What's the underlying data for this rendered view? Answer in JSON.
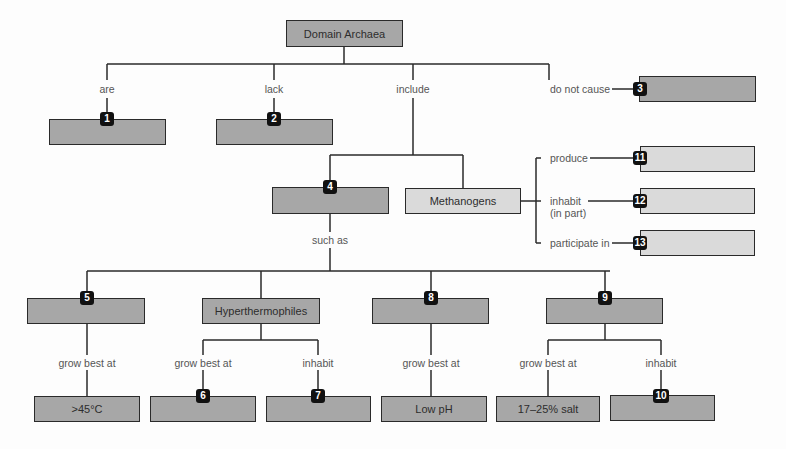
{
  "diagram": {
    "type": "concept-map",
    "colors": {
      "box_dark": "#a7a7a7",
      "box_light": "#dadada",
      "line": "#2a2a2a",
      "badge": "#111111"
    },
    "root": {
      "label": "Domain Archaea"
    },
    "links": {
      "are": "are",
      "lack": "lack",
      "include": "include",
      "do_not_cause": "do not cause",
      "such_as": "such as",
      "produce": "produce",
      "inhabit_in_part": "inhabit\n(in part)",
      "participate_in": "participate in",
      "grow_best_at_5": "grow best at",
      "grow_best_at_hyper": "grow best at",
      "inhabit_hyper": "inhabit",
      "grow_best_at_8": "grow best at",
      "grow_best_at_9": "grow best at",
      "inhabit_9": "inhabit"
    },
    "nodes": {
      "n1": {
        "badge": "1",
        "label": ""
      },
      "n2": {
        "badge": "2",
        "label": ""
      },
      "n3": {
        "badge": "3",
        "label": ""
      },
      "n4": {
        "badge": "4",
        "label": ""
      },
      "methanogens": {
        "label": "Methanogens"
      },
      "n11": {
        "badge": "11",
        "label": ""
      },
      "n12": {
        "badge": "12",
        "label": ""
      },
      "n13": {
        "badge": "13",
        "label": ""
      },
      "n5": {
        "badge": "5",
        "label": ""
      },
      "hyperthermophiles": {
        "label": "Hyperthermophiles"
      },
      "n8": {
        "badge": "8",
        "label": ""
      },
      "n9": {
        "badge": "9",
        "label": ""
      },
      "temp45": {
        "label": ">45°C"
      },
      "n6": {
        "badge": "6",
        "label": ""
      },
      "n7": {
        "badge": "7",
        "label": ""
      },
      "lowph": {
        "label": "Low pH"
      },
      "salt": {
        "label": "17–25% salt"
      },
      "n10": {
        "badge": "10",
        "label": ""
      }
    }
  }
}
